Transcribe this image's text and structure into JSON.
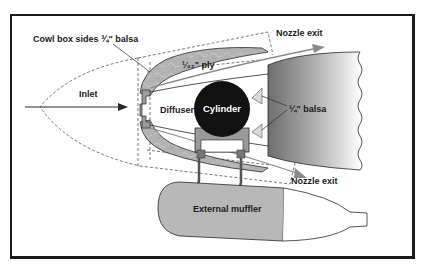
{
  "diagram": {
    "type": "cross-section",
    "labels": {
      "cowl_box_sides": "Cowl box sides ¾\" balsa",
      "ply": "¹⁄₃₂\" ply",
      "inlet": "Inlet",
      "diffuser": "Diffuser",
      "cylinder": "Cylinder",
      "nozzle_exit_top": "Nozzle exit",
      "nozzle_exit_bottom": "Nozzle exit",
      "balsa_quarter": "¼\" balsa",
      "external_muffler": "External muffler"
    },
    "components": [
      {
        "name": "cowl-outline",
        "style": "dashed"
      },
      {
        "name": "cowl-shell",
        "fill": "#b5b5b5"
      },
      {
        "name": "cylinder",
        "fill": "#111111"
      },
      {
        "name": "fuselage-section",
        "fill": "gradient gray-to-white"
      },
      {
        "name": "external-muffler",
        "fill": "#b8b8b8"
      },
      {
        "name": "airflow-arrows",
        "color": "#8a8a8a"
      }
    ],
    "colors": {
      "shell": "#b5b5b5",
      "shell_dark": "#8c8c8c",
      "line": "#2a2a2a",
      "arrow": "#8a8a8a",
      "cylinder": "#111111",
      "frame": "#1a1a1a"
    }
  }
}
